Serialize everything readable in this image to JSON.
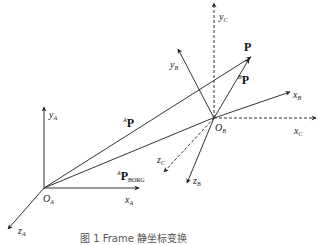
{
  "figure": {
    "caption": "图 1  Frame 静坐标变换",
    "points": {
      "O_A": [
        44,
        188
      ],
      "O_B": [
        214,
        118
      ],
      "P": [
        250,
        57
      ]
    },
    "colors": {
      "line": "#333333",
      "text": "#222222",
      "background": "#ffffff"
    }
  },
  "labels": {
    "y_A": {
      "base": "y",
      "sub": "A"
    },
    "x_A": {
      "base": "x",
      "sub": "A"
    },
    "z_A": {
      "base": "z",
      "sub": "A"
    },
    "O_A": {
      "base": "O",
      "sub": "A"
    },
    "O_B": {
      "base": "O",
      "sub": "B"
    },
    "y_B": {
      "base": "y",
      "sub": "B"
    },
    "x_B": {
      "base": "x",
      "sub": "B"
    },
    "z_B": {
      "base": "z",
      "sub": "B"
    },
    "y_C": {
      "base": "y",
      "sub": "C"
    },
    "x_C": {
      "base": "x",
      "sub": "C"
    },
    "z_C": {
      "base": "z",
      "sub": "C"
    }
  },
  "vectors": {
    "AP": {
      "pre": "A",
      "base": "P"
    },
    "P": {
      "base": "P"
    },
    "BP": {
      "pre": "B",
      "base": "P"
    },
    "APBORG": {
      "pre": "A",
      "base": "P",
      "sub": "BORG"
    }
  }
}
